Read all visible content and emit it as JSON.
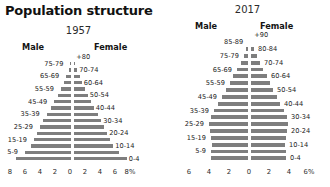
{
  "title": "Population structure",
  "panels": [
    {
      "id": "pyramid-1957",
      "year": "1957",
      "male_label": "Male",
      "female_label": "Female",
      "axis_ticks": [
        "8",
        "6",
        "4",
        "2",
        "0",
        "2",
        "4",
        "6",
        "8%"
      ],
      "axis_max": 8,
      "axis_unit": "%"
    },
    {
      "id": "pyramid-2017",
      "year": "2017",
      "male_label": "Male",
      "female_label": "Female",
      "axis_ticks": [
        "6",
        "4",
        "2",
        "0",
        "2",
        "4",
        "6%"
      ],
      "axis_max": 6,
      "axis_unit": "%"
    }
  ],
  "chart_data": [
    {
      "type": "bar",
      "subtype": "population-pyramid",
      "title": "Population structure",
      "year": "1957",
      "xlabel": "",
      "ylabel": "",
      "xlim": [
        -8,
        8
      ],
      "x_unit": "% of total population",
      "grid": false,
      "legend": [
        "Male",
        "Female"
      ],
      "categories": [
        "0-4",
        "5-9",
        "10-14",
        "15-19",
        "20-24",
        "25-29",
        "30-34",
        "35-39",
        "40-44",
        "45-49",
        "50-54",
        "55-59",
        "60-64",
        "65-69",
        "70-74",
        "75-79",
        "+80"
      ],
      "series": [
        {
          "name": "Male",
          "values": [
            7.6,
            6.4,
            5.6,
            5.2,
            4.8,
            4.4,
            4.0,
            3.5,
            3.0,
            2.5,
            2.0,
            1.6,
            1.2,
            0.9,
            0.6,
            0.35,
            0.2
          ]
        },
        {
          "name": "Female",
          "values": [
            7.3,
            6.2,
            5.5,
            5.1,
            4.7,
            4.3,
            3.9,
            3.4,
            2.9,
            2.5,
            2.1,
            1.7,
            1.3,
            1.0,
            0.7,
            0.45,
            0.3
          ]
        }
      ],
      "label_side": {
        "left": [
          "5-9",
          "15-19",
          "25-29",
          "35-39",
          "45-49",
          "55-59",
          "65-69",
          "75-79"
        ],
        "right": [
          "0-4",
          "10-14",
          "20-24",
          "30-34",
          "40-44",
          "50-54",
          "60-64",
          "70-74",
          "+80"
        ]
      }
    },
    {
      "type": "bar",
      "subtype": "population-pyramid",
      "title": "Population structure",
      "year": "2017",
      "xlabel": "",
      "ylabel": "",
      "xlim": [
        -6,
        6
      ],
      "x_unit": "% of total population",
      "grid": false,
      "legend": [
        "Male",
        "Female"
      ],
      "categories": [
        "0-4",
        "5-9",
        "10-14",
        "15-19",
        "20-24",
        "25-29",
        "30-34",
        "35-39",
        "40-44",
        "45-49",
        "50-54",
        "55-59",
        "60-64",
        "65-69",
        "70-74",
        "75-79",
        "80-84",
        "85-89",
        "+90"
      ],
      "series": [
        {
          "name": "Male",
          "values": [
            3.9,
            3.9,
            3.8,
            3.9,
            4.0,
            4.1,
            3.9,
            3.6,
            3.2,
            2.8,
            2.4,
            2.0,
            1.7,
            1.3,
            0.9,
            0.6,
            0.35,
            0.18,
            0.07
          ]
        },
        {
          "name": "Female",
          "values": [
            3.7,
            3.7,
            3.6,
            3.7,
            3.8,
            3.9,
            3.8,
            3.5,
            3.1,
            2.8,
            2.4,
            2.1,
            1.8,
            1.4,
            1.1,
            0.8,
            0.5,
            0.28,
            0.12
          ]
        }
      ],
      "label_side": {
        "left": [
          "5-9",
          "15-19",
          "25-29",
          "35-39",
          "45-49",
          "55-59",
          "65-69",
          "75-79",
          "85-89"
        ],
        "right": [
          "0-4",
          "10-14",
          "20-24",
          "30-34",
          "40-44",
          "50-54",
          "60-64",
          "70-74",
          "80-84",
          "+90"
        ]
      }
    }
  ]
}
